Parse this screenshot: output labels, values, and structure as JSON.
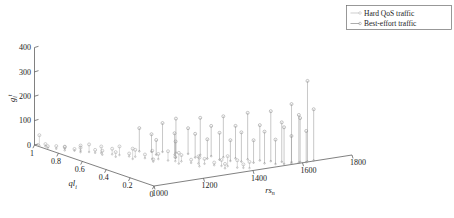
{
  "figure": {
    "title": "",
    "caption_partial": ""
  },
  "legend": {
    "position": "top-right",
    "items": [
      {
        "label": "Hard QoS traffic",
        "marker": "stem-circle",
        "color": "#b9b9b9"
      },
      {
        "label": "Best-effort traffic",
        "marker": "stem-circle",
        "color": "#8a8a8a"
      }
    ]
  },
  "axes": {
    "z": {
      "label_base": "g",
      "label_sub": "i",
      "label_sup": "t",
      "ticks": [
        0,
        100,
        200,
        300,
        400
      ],
      "range": [
        0,
        400
      ]
    },
    "x": {
      "label_base": "ql",
      "label_sub": "i",
      "ticks": [
        1,
        0.8,
        0.6,
        0.4,
        0.2,
        0
      ],
      "tick_labels": [
        "1",
        "0.8",
        "0.6",
        "0.4",
        "0.2",
        "0"
      ],
      "range": [
        1,
        0
      ]
    },
    "y": {
      "label_base": "rs",
      "label_sub": "n",
      "ticks": [
        1000,
        1200,
        1400,
        1600,
        1800
      ],
      "tick_labels": [
        "1000",
        "1200",
        "1400",
        "1600",
        "1800"
      ],
      "range": [
        1000,
        1800
      ]
    }
  },
  "chart_data": {
    "type": "scatter",
    "subtype": "3d-stem",
    "title": "",
    "xlabel": "ql_i",
    "ylabel": "rs_n",
    "zlabel": "g_i^t",
    "xlim": [
      1,
      0
    ],
    "ylim": [
      1000,
      1800
    ],
    "zlim": [
      0,
      400
    ],
    "grid": false,
    "legend_position": "top-right",
    "series": [
      {
        "name": "Hard QoS traffic",
        "color": "#b9b9b9",
        "points": [
          {
            "x": 0.98,
            "y": 1010,
            "z": 42
          },
          {
            "x": 0.95,
            "y": 1020,
            "z": 9
          },
          {
            "x": 0.92,
            "y": 1015,
            "z": 6
          },
          {
            "x": 0.88,
            "y": 1030,
            "z": 11
          },
          {
            "x": 0.86,
            "y": 1055,
            "z": 8
          },
          {
            "x": 0.83,
            "y": 1040,
            "z": 14
          },
          {
            "x": 0.8,
            "y": 1065,
            "z": 7
          },
          {
            "x": 0.78,
            "y": 1080,
            "z": 22
          },
          {
            "x": 0.76,
            "y": 1070,
            "z": 18
          },
          {
            "x": 0.74,
            "y": 1095,
            "z": 31
          },
          {
            "x": 0.71,
            "y": 1105,
            "z": 12
          },
          {
            "x": 0.69,
            "y": 1120,
            "z": 27
          },
          {
            "x": 0.66,
            "y": 1110,
            "z": 16
          },
          {
            "x": 0.64,
            "y": 1140,
            "z": 23
          },
          {
            "x": 0.61,
            "y": 1155,
            "z": 35
          },
          {
            "x": 0.59,
            "y": 1130,
            "z": 19
          },
          {
            "x": 0.56,
            "y": 1170,
            "z": 12
          },
          {
            "x": 0.54,
            "y": 1185,
            "z": 28
          },
          {
            "x": 0.51,
            "y": 1160,
            "z": 42
          },
          {
            "x": 0.49,
            "y": 1200,
            "z": 15
          },
          {
            "x": 0.46,
            "y": 1215,
            "z": 33
          },
          {
            "x": 0.44,
            "y": 1230,
            "z": 21
          },
          {
            "x": 0.41,
            "y": 1195,
            "z": 9
          },
          {
            "x": 0.39,
            "y": 1245,
            "z": 38
          },
          {
            "x": 0.36,
            "y": 1260,
            "z": 17
          },
          {
            "x": 0.34,
            "y": 1275,
            "z": 26
          },
          {
            "x": 0.31,
            "y": 1250,
            "z": 44
          },
          {
            "x": 0.29,
            "y": 1290,
            "z": 13
          },
          {
            "x": 0.26,
            "y": 1305,
            "z": 29
          },
          {
            "x": 0.24,
            "y": 1320,
            "z": 20
          },
          {
            "x": 0.21,
            "y": 1285,
            "z": 36
          },
          {
            "x": 0.19,
            "y": 1335,
            "z": 11
          },
          {
            "x": 0.16,
            "y": 1350,
            "z": 24
          },
          {
            "x": 0.14,
            "y": 1365,
            "z": 41
          },
          {
            "x": 0.11,
            "y": 1340,
            "z": 18
          },
          {
            "x": 0.09,
            "y": 1380,
            "z": 30
          },
          {
            "x": 0.07,
            "y": 1395,
            "z": 14
          },
          {
            "x": 0.05,
            "y": 1410,
            "z": 25
          }
        ]
      },
      {
        "name": "Best-effort traffic",
        "color": "#8a8a8a",
        "points": [
          {
            "x": 0.62,
            "y": 1240,
            "z": 95
          },
          {
            "x": 0.58,
            "y": 1270,
            "z": 72
          },
          {
            "x": 0.55,
            "y": 1300,
            "z": 118
          },
          {
            "x": 0.52,
            "y": 1260,
            "z": 60
          },
          {
            "x": 0.5,
            "y": 1330,
            "z": 140
          },
          {
            "x": 0.47,
            "y": 1310,
            "z": 88
          },
          {
            "x": 0.45,
            "y": 1355,
            "z": 105
          },
          {
            "x": 0.42,
            "y": 1290,
            "z": 66
          },
          {
            "x": 0.4,
            "y": 1380,
            "z": 152
          },
          {
            "x": 0.37,
            "y": 1345,
            "z": 97
          },
          {
            "x": 0.35,
            "y": 1400,
            "z": 124
          },
          {
            "x": 0.32,
            "y": 1370,
            "z": 79
          },
          {
            "x": 0.3,
            "y": 1425,
            "z": 168
          },
          {
            "x": 0.27,
            "y": 1395,
            "z": 110
          },
          {
            "x": 0.25,
            "y": 1450,
            "z": 133
          },
          {
            "x": 0.22,
            "y": 1415,
            "z": 85
          },
          {
            "x": 0.2,
            "y": 1475,
            "z": 191
          },
          {
            "x": 0.18,
            "y": 1440,
            "z": 120
          },
          {
            "x": 0.15,
            "y": 1500,
            "z": 145
          },
          {
            "x": 0.13,
            "y": 1465,
            "z": 92
          },
          {
            "x": 0.11,
            "y": 1525,
            "z": 205
          },
          {
            "x": 0.09,
            "y": 1490,
            "z": 130
          },
          {
            "x": 0.07,
            "y": 1550,
            "z": 162
          },
          {
            "x": 0.05,
            "y": 1515,
            "z": 100
          },
          {
            "x": 0.04,
            "y": 1575,
            "z": 238
          },
          {
            "x": 0.03,
            "y": 1540,
            "z": 150
          },
          {
            "x": 0.02,
            "y": 1600,
            "z": 180
          },
          {
            "x": 0.02,
            "y": 1565,
            "z": 112
          },
          {
            "x": 0.01,
            "y": 1625,
            "z": 330
          },
          {
            "x": 0.01,
            "y": 1590,
            "z": 196
          },
          {
            "x": 0.01,
            "y": 1650,
            "z": 210
          },
          {
            "x": 0.0,
            "y": 1615,
            "z": 128
          }
        ]
      }
    ]
  }
}
